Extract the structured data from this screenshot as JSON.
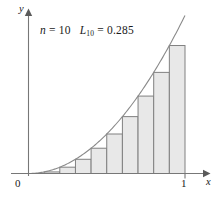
{
  "figure": {
    "annotation": {
      "n_label": "n",
      "n_eq": "=",
      "n_value": "10",
      "sum_label": "L",
      "sum_subscript": "10",
      "sum_eq": "=",
      "sum_value": "0.285"
    },
    "axes": {
      "y_axis_label": "y",
      "x_axis_label": "x",
      "origin_label": "0",
      "x_tick_label": "1"
    },
    "colors": {
      "bar_fill": "#e8e8e8",
      "bar_stroke": "#808080",
      "curve": "#8a8a8a",
      "axis": "#777777",
      "text": "#1a1a1a"
    }
  },
  "chart_data": {
    "type": "bar",
    "title": "",
    "subtitle": "",
    "xlabel": "x",
    "ylabel": "y",
    "xlim": [
      0,
      1
    ],
    "ylim": [
      0,
      1
    ],
    "grid": false,
    "legend": null,
    "annotations": [
      "n = 10",
      "L10 = 0.285"
    ],
    "n_rectangles": 10,
    "riemann_type": "left-endpoint",
    "riemann_sum_value": 0.285,
    "function": "y = x^2",
    "categories": [
      "0.0",
      "0.1",
      "0.2",
      "0.3",
      "0.4",
      "0.5",
      "0.6",
      "0.7",
      "0.8",
      "0.9"
    ],
    "bar_left_edges": [
      0.0,
      0.1,
      0.2,
      0.3,
      0.4,
      0.5,
      0.6,
      0.7,
      0.8,
      0.9
    ],
    "bar_width": 0.1,
    "values": [
      0.0,
      0.01,
      0.04,
      0.09,
      0.16,
      0.25,
      0.36,
      0.49,
      0.64,
      0.81
    ],
    "curve_series": {
      "name": "y = x^2",
      "x": [
        0.0,
        0.1,
        0.2,
        0.3,
        0.4,
        0.5,
        0.6,
        0.7,
        0.8,
        0.9,
        1.0
      ],
      "y": [
        0.0,
        0.01,
        0.04,
        0.09,
        0.16,
        0.25,
        0.36,
        0.49,
        0.64,
        0.81,
        1.0
      ]
    },
    "xticks": [
      0,
      1
    ],
    "xticklabels": [
      "0",
      "1"
    ],
    "yticks": [],
    "yticklabels": []
  }
}
